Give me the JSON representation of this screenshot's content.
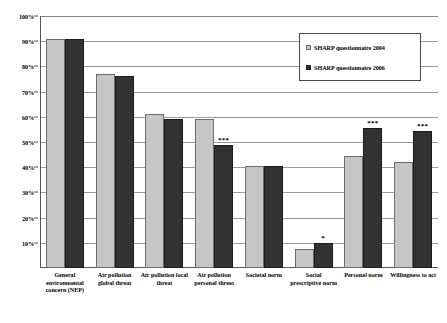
{
  "chart_data": {
    "type": "bar",
    "title": "",
    "xlabel": "",
    "ylabel": "",
    "ylim": [
      0,
      100
    ],
    "ytick_labels": [
      "100%",
      "90%",
      "80%",
      "70%",
      "60%",
      "50%",
      "40%",
      "30%",
      "20%",
      "10%",
      "0%"
    ],
    "ytick_values": [
      100,
      90,
      80,
      70,
      60,
      50,
      40,
      30,
      20,
      10,
      0
    ],
    "grid": true,
    "legend_position": "top-right",
    "categories": [
      "General environmental concern (NEP)",
      "Air pollution global threat",
      "Air pollution local threat",
      "Air pollution personal threat",
      "Societal norm",
      "Social prescriptive norm",
      "Personal norm",
      "Willingness to act"
    ],
    "series": [
      {
        "name": "SHARP questionnaire 2004",
        "color": "#c6c6c6",
        "values": [
          91,
          77,
          61,
          59,
          40.5,
          7.5,
          44.5,
          42
        ]
      },
      {
        "name": "SHARP questionnaire 2006",
        "color": "#323232",
        "values": [
          91,
          76,
          59,
          49,
          40.5,
          10,
          55.5,
          54.5
        ]
      }
    ],
    "annotations": [
      {
        "category_index": 3,
        "series_index": 1,
        "text": "***"
      },
      {
        "category_index": 5,
        "series_index": 1,
        "text": "*"
      },
      {
        "category_index": 6,
        "series_index": 1,
        "text": "***"
      },
      {
        "category_index": 7,
        "series_index": 1,
        "text": "***"
      }
    ]
  },
  "legend": {
    "items": [
      {
        "label": "SHARP questionnaire 2004",
        "swatch": "s2004"
      },
      {
        "label": "SHARP questionnaire 2006",
        "swatch": "s2006"
      }
    ]
  }
}
